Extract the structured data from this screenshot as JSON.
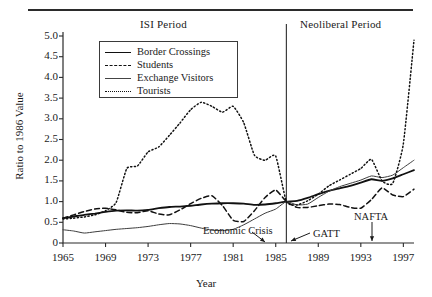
{
  "chart_data": {
    "type": "line",
    "title": "",
    "xlabel": "Year",
    "ylabel": "Ratio to 1986 Value",
    "xlim": [
      1965,
      1998
    ],
    "ylim": [
      0,
      5.0
    ],
    "grid": false,
    "legend_position": "top-center",
    "xticks": [
      "1965",
      "1969",
      "1973",
      "1977",
      "1981",
      "1985",
      "1989",
      "1993",
      "1997"
    ],
    "xtick_values": [
      1965,
      1969,
      1973,
      1977,
      1981,
      1985,
      1989,
      1993,
      1997
    ],
    "yticks": [
      "0",
      "0.5",
      "1.0",
      "1.5",
      "2.0",
      "2.5",
      "3.0",
      "3.5",
      "4.0",
      "4.5",
      "5.0"
    ],
    "ytick_values": [
      0,
      0.5,
      1.0,
      1.5,
      2.0,
      2.5,
      3.0,
      3.5,
      4.0,
      4.5,
      5.0
    ],
    "x": [
      1965,
      1966,
      1967,
      1968,
      1969,
      1970,
      1971,
      1972,
      1973,
      1974,
      1975,
      1976,
      1977,
      1978,
      1979,
      1980,
      1981,
      1982,
      1983,
      1984,
      1985,
      1986,
      1987,
      1988,
      1989,
      1990,
      1991,
      1992,
      1993,
      1994,
      1995,
      1996,
      1997,
      1998
    ],
    "series": [
      {
        "name": "Border Crossings",
        "style": "solid",
        "values": [
          0.6,
          0.64,
          0.68,
          0.71,
          0.75,
          0.78,
          0.79,
          0.78,
          0.8,
          0.84,
          0.87,
          0.88,
          0.9,
          0.93,
          0.95,
          0.96,
          0.96,
          0.95,
          0.92,
          0.93,
          0.96,
          1.0,
          1.02,
          1.09,
          1.18,
          1.26,
          1.32,
          1.38,
          1.46,
          1.54,
          1.5,
          1.56,
          1.66,
          1.76
        ]
      },
      {
        "name": "Students",
        "style": "dashed",
        "values": [
          0.6,
          0.68,
          0.76,
          0.82,
          0.84,
          0.8,
          0.74,
          0.73,
          0.78,
          0.7,
          0.68,
          0.8,
          0.95,
          1.08,
          1.14,
          0.9,
          0.55,
          0.52,
          0.78,
          1.1,
          1.28,
          1.0,
          0.86,
          0.86,
          0.9,
          0.94,
          0.93,
          0.86,
          0.84,
          1.05,
          1.33,
          1.16,
          1.12,
          1.3
        ]
      },
      {
        "name": "Exchange Visitors",
        "style": "thin",
        "values": [
          0.32,
          0.29,
          0.24,
          0.27,
          0.3,
          0.33,
          0.35,
          0.37,
          0.4,
          0.44,
          0.47,
          0.46,
          0.42,
          0.36,
          0.31,
          0.3,
          0.33,
          0.44,
          0.58,
          0.72,
          0.82,
          1.0,
          0.92,
          0.94,
          1.1,
          1.25,
          1.36,
          1.44,
          1.52,
          1.62,
          1.58,
          1.64,
          1.82,
          2.0
        ]
      },
      {
        "name": "Tourists",
        "style": "dotted",
        "values": [
          0.58,
          0.6,
          0.63,
          0.68,
          0.78,
          0.98,
          1.8,
          1.86,
          2.2,
          2.32,
          2.6,
          2.9,
          3.22,
          3.4,
          3.3,
          3.16,
          3.3,
          2.9,
          2.12,
          2.0,
          2.1,
          1.0,
          0.92,
          1.02,
          1.18,
          1.38,
          1.52,
          1.66,
          1.8,
          2.02,
          1.5,
          1.44,
          2.4,
          4.9
        ]
      }
    ],
    "annotations": [
      {
        "label": "Economic Crisis",
        "x": 1982,
        "arrow": "down-right"
      },
      {
        "label": "GATT",
        "x": 1986,
        "arrow": "down-left"
      },
      {
        "label": "NAFTA",
        "x": 1994,
        "arrow": "down"
      }
    ],
    "period_divider": {
      "x": 1986
    },
    "periods": [
      {
        "label": "ISI Period"
      },
      {
        "label": "Neoliberal Period"
      }
    ]
  },
  "legend": {
    "items": [
      {
        "label": "Border Crossings"
      },
      {
        "label": "Students"
      },
      {
        "label": "Exchange Visitors"
      },
      {
        "label": "Tourists"
      }
    ]
  }
}
